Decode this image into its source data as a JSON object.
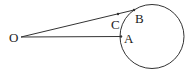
{
  "diagram": {
    "points": {
      "O": {
        "label": "O"
      },
      "A": {
        "label": "A"
      },
      "B": {
        "label": "B"
      },
      "C": {
        "label": "C"
      }
    },
    "segments": [
      {
        "from": "O",
        "to": "B"
      },
      {
        "from": "O",
        "to": "A"
      }
    ],
    "circle": {
      "label": ""
    },
    "colors": {
      "stroke": "#333333",
      "text": "#222222",
      "background": "#ffffff"
    }
  }
}
